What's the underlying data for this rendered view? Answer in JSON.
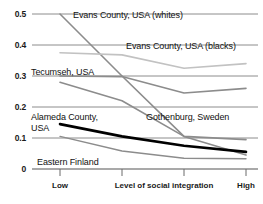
{
  "chart_data": {
    "type": "line",
    "title": "",
    "xlabel": "Level of social integration",
    "ylabel": "",
    "xlim": [
      0,
      3
    ],
    "ylim": [
      0,
      0.5
    ],
    "grid": true,
    "legend": "inline-annotations",
    "x": [
      0,
      1,
      2,
      3
    ],
    "x_tick_labels": [
      "Low",
      "",
      "",
      "High"
    ],
    "y_tick_labels": [
      "0",
      "0.1",
      "0.2",
      "0.3",
      "0.4",
      "0.5"
    ],
    "y_ticks": [
      0,
      0.1,
      0.2,
      0.3,
      0.4,
      0.5
    ],
    "series": [
      {
        "name": "Evans County, USA (whites)",
        "values": [
          0.5,
          0.3,
          0.105,
          0.095
        ],
        "color": "#8c8c8c",
        "width": 1.6
      },
      {
        "name": "Evans County, USA (blacks)",
        "values": [
          0.375,
          0.368,
          0.325,
          0.34
        ],
        "color": "#c2c2c2",
        "width": 1.6
      },
      {
        "name": "Tecumseh, USA",
        "values": [
          0.3,
          0.298,
          0.245,
          0.26
        ],
        "color": "#8c8c8c",
        "width": 1.6
      },
      {
        "name": "Gothenburg, Sweden",
        "values": [
          0.28,
          0.22,
          0.105,
          0.045
        ],
        "color": "#8c8c8c",
        "width": 1.6
      },
      {
        "name": "Alameda County, USA",
        "values": [
          0.145,
          0.105,
          0.075,
          0.055
        ],
        "color": "#000000",
        "width": 2.6
      },
      {
        "name": "Eastern Finland",
        "values": [
          0.105,
          0.058,
          0.035,
          0.033
        ],
        "color": "#8c8c8c",
        "width": 1.4
      }
    ],
    "annotations": [
      {
        "text": "Evans County, USA (whites)",
        "series": 0
      },
      {
        "text": "Evans County, USA (blacks)",
        "series": 1
      },
      {
        "text": "Tecumseh, USA",
        "series": 2
      },
      {
        "text": "Gothenburg, Sweden",
        "series": 3
      },
      {
        "text": "Alameda County,",
        "series": 4
      },
      {
        "text": "USA",
        "series": 4
      },
      {
        "text": "Eastern Finland",
        "series": 5
      }
    ]
  },
  "axes": {
    "y_labels": [
      "0.5",
      "0.4",
      "0.3",
      "0.2",
      "0.1",
      "0"
    ],
    "x_labels": {
      "low": "Low",
      "high": "High",
      "axis_title": "Level of social integration"
    }
  },
  "labels": {
    "evans_whites": "Evans County, USA (whites)",
    "evans_blacks": "Evans County, USA (blacks)",
    "tecumseh": "Tecumseh, USA",
    "gothenburg": "Gothenburg, Sweden",
    "alameda_line1": "Alameda County,",
    "alameda_line2": "USA",
    "eastern_finland": "Eastern Finland"
  },
  "colors": {
    "grid": "#8c8c8c",
    "axis_text": "#1a1a1a",
    "highlight_series": "#000000",
    "normal_series": "#8c8c8c",
    "light_series": "#c2c2c2"
  }
}
